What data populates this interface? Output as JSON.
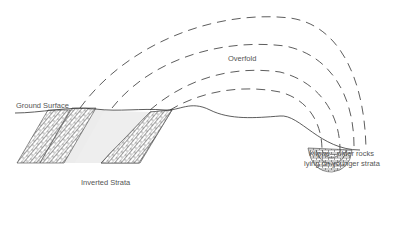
{
  "diagram": {
    "labels": {
      "overfold": "Overfold",
      "ground_surface": "Ground Surface",
      "klippe_line1": "Klippe—older rocks",
      "klippe_line2": "lying on younger strata",
      "inverted_strata": "Inverted Strata"
    },
    "colors": {
      "line": "#333333",
      "fill": "#ececec",
      "text": "#555555"
    }
  }
}
